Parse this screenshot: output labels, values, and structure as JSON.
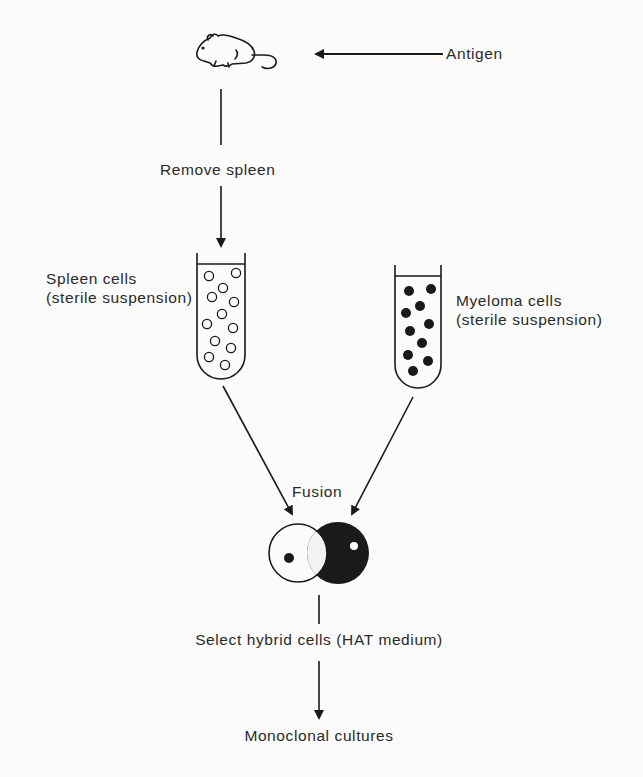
{
  "diagram": {
    "labels": {
      "antigen": "Antigen",
      "remove_spleen": "Remove spleen",
      "spleen_cells_line1": "Spleen cells",
      "spleen_cells_line2": "(sterile suspension)",
      "myeloma_cells_line1": "Myeloma cells",
      "myeloma_cells_line2": "(sterile suspension)",
      "fusion": "Fusion",
      "select_hybrid": "Select hybrid cells (HAT medium)",
      "monoclonal": "Monoclonal cultures"
    },
    "nodes": [
      {
        "id": "mouse",
        "type": "icon",
        "icon": "mouse-icon"
      },
      {
        "id": "spleen-tube",
        "type": "test-tube",
        "cells": "open-circles",
        "cell_count": 12
      },
      {
        "id": "myeloma-tube",
        "type": "test-tube",
        "cells": "filled-circles",
        "cell_count": 10
      },
      {
        "id": "hybrid",
        "type": "fused-cells",
        "icon": "hybrid-cell-icon"
      }
    ],
    "edges": [
      {
        "from": "antigen",
        "to": "mouse"
      },
      {
        "from": "mouse",
        "to": "spleen-tube",
        "label": "Remove spleen"
      },
      {
        "from": "spleen-tube",
        "to": "hybrid",
        "label": "Fusion"
      },
      {
        "from": "myeloma-tube",
        "to": "hybrid",
        "label": "Fusion"
      },
      {
        "from": "hybrid",
        "to": "monoclonal",
        "label": "Select hybrid cells (HAT medium)"
      }
    ],
    "colors": {
      "ink": "#1a1a1a",
      "background": "#fbfbfb"
    }
  }
}
